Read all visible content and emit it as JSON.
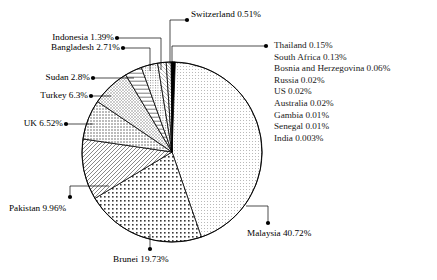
{
  "chart_data": {
    "type": "pie",
    "title": "",
    "legend_position": "callout-labels",
    "grid": false,
    "value_unit": "%",
    "categories": [
      "Malaysia",
      "Brunei",
      "Pakistan",
      "UK",
      "Turkey",
      "Sudan",
      "Bangladesh",
      "Indonesia",
      "Switzerland",
      "Thailand",
      "South Africa",
      "Bosnia and Herzegovina",
      "Russia",
      "US",
      "Australia",
      "Gambia",
      "Senegal",
      "India"
    ],
    "values": [
      40.72,
      19.73,
      9.96,
      6.52,
      6.3,
      2.8,
      2.71,
      1.39,
      0.51,
      0.15,
      0.13,
      0.06,
      0.02,
      0.02,
      0.02,
      0.01,
      0.01,
      0.003
    ],
    "labels": [
      "Malaysia 40.72%",
      "Brunei 19.73%",
      "Pakistan 9.96%",
      "UK 6.52%",
      "Turkey 6.3%",
      "Sudan 2.8%",
      "Bangladesh 2.71%",
      "Indonesia 1.39%",
      "Switzerland 0.51%",
      "Thailand 0.15%",
      "South Africa 0.13%",
      "Bosnia and Herzegovina 0.06%",
      "Russia 0.02%",
      "US 0.02%",
      "Australia 0.02%",
      "Gambia 0.01%",
      "Senegal 0.01%",
      "India 0.003%"
    ]
  },
  "callouts": {
    "switzerland": "Switzerland 0.51%",
    "indonesia": "Indonesia 1.39%",
    "bangladesh": "Bangladesh 2.71%",
    "sudan": "Sudan 2.8%",
    "turkey": "Turkey 6.3%",
    "uk": "UK 6.52%",
    "pakistan": "Pakistan 9.96%",
    "brunei": "Brunei 19.73%",
    "malaysia": "Malaysia 40.72%"
  },
  "small_slice_list": [
    "Thailand 0.15%",
    "South Africa 0.13%",
    "Bosnia and Herzegovina 0.06%",
    "Russia 0.02%",
    "US 0.02%",
    "Australia 0.02%",
    "Gambia 0.01%",
    "Senegal 0.01%",
    "India 0.003%"
  ],
  "colors": {
    "outline": "#000000",
    "fill_light": "#ffffff",
    "switzerland_fill": "#000000",
    "text": "#000000"
  }
}
